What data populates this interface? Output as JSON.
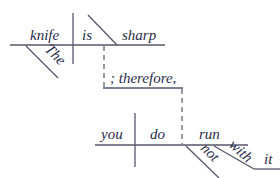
{
  "diagram": {
    "type": "sentence-diagram",
    "clause1": {
      "subject": "knife",
      "verb": "is",
      "complement": "sharp",
      "modifier": "The"
    },
    "connector": "; therefore,",
    "clause2": {
      "subject": "you",
      "verb": "do",
      "main_verb": "run",
      "modifier_not": "not",
      "preposition": "with",
      "object": "it"
    }
  }
}
